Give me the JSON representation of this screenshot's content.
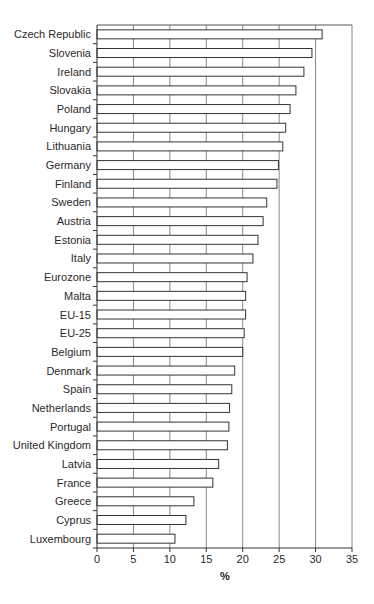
{
  "chart_data": {
    "type": "bar",
    "orientation": "horizontal",
    "title": "",
    "xlabel": "%",
    "ylabel": "",
    "xlim": [
      0,
      35
    ],
    "x_ticks": [
      0,
      5,
      10,
      15,
      20,
      25,
      30,
      35
    ],
    "grid": true,
    "legend": null,
    "categories": [
      "Czech Republic",
      "Slovenia",
      "Ireland",
      "Slovakia",
      "Poland",
      "Hungary",
      "Lithuania",
      "Germany",
      "Finland",
      "Sweden",
      "Austria",
      "Estonia",
      "Italy",
      "Eurozone",
      "Malta",
      "EU-15",
      "EU-25",
      "Belgium",
      "Denmark",
      "Spain",
      "Netherlands",
      "Portugal",
      "United Kingdom",
      "Latvia",
      "France",
      "Greece",
      "Cyprus",
      "Luxembourg"
    ],
    "values": [
      30.9,
      29.5,
      28.4,
      27.3,
      26.5,
      25.9,
      25.5,
      24.9,
      24.7,
      23.3,
      22.8,
      22.1,
      21.4,
      20.6,
      20.4,
      20.4,
      20.2,
      20.0,
      18.9,
      18.5,
      18.2,
      18.1,
      17.9,
      16.7,
      15.9,
      13.3,
      12.2,
      10.7
    ]
  }
}
